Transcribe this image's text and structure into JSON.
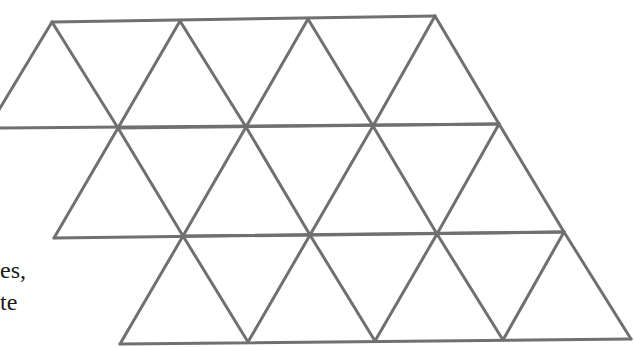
{
  "figure": {
    "stroke_color": "#707070",
    "stroke_width": 3,
    "rows": [
      {
        "name": "row-1",
        "top_vertices": [
          [
            52,
            22
          ],
          [
            180,
            21
          ],
          [
            308,
            19
          ],
          [
            435,
            16
          ]
        ],
        "bottom_vertices": [
          [
            -12,
            128
          ],
          [
            118,
            128
          ],
          [
            246,
            127
          ],
          [
            373,
            126
          ],
          [
            499,
            124
          ]
        ]
      },
      {
        "name": "row-2",
        "top_vertices": [
          [
            118,
            128
          ],
          [
            246,
            127
          ],
          [
            373,
            126
          ],
          [
            499,
            124
          ]
        ],
        "bottom_vertices": [
          [
            54,
            238
          ],
          [
            183,
            236
          ],
          [
            310,
            235
          ],
          [
            437,
            234
          ],
          [
            564,
            232
          ]
        ]
      },
      {
        "name": "row-3",
        "top_vertices": [
          [
            183,
            236
          ],
          [
            310,
            235
          ],
          [
            437,
            234
          ],
          [
            564,
            232
          ]
        ],
        "bottom_vertices": [
          [
            120,
            344
          ],
          [
            248,
            342
          ],
          [
            375,
            341
          ],
          [
            503,
            340
          ],
          [
            631,
            339
          ]
        ]
      }
    ]
  },
  "text_fragments": [
    {
      "text": "es,",
      "x": 0,
      "y": 258
    },
    {
      "text": "te",
      "x": 0,
      "y": 290
    }
  ]
}
